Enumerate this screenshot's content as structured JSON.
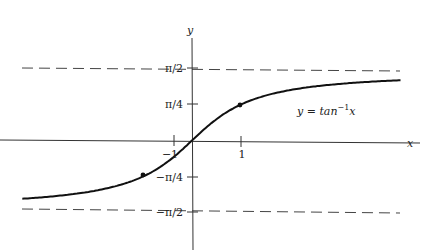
{
  "chart_data": {
    "type": "line",
    "title": "",
    "xlabel": "x",
    "ylabel": "y",
    "function_label": "y = tan⁻¹x",
    "function_label_parts": {
      "prefix": "y = tan",
      "sup": "−1",
      "var": "x"
    },
    "x_ticks": [
      {
        "value": -1,
        "label": "−1"
      },
      {
        "value": 1,
        "label": "1"
      }
    ],
    "y_ticks": [
      {
        "value": 1.5708,
        "label": "π/2"
      },
      {
        "value": 0.7854,
        "label": "π/4"
      },
      {
        "value": -0.7854,
        "label": "−π/4"
      },
      {
        "value": -1.5708,
        "label": "−π/2"
      }
    ],
    "asymptotes": [
      {
        "y": 1.5708,
        "style": "dashed",
        "label": "π/2"
      },
      {
        "y": -1.5708,
        "style": "dashed",
        "label": "−π/2"
      }
    ],
    "marked_points": [
      {
        "x": 1,
        "y": 0.7854
      },
      {
        "x": -1,
        "y": -0.7854
      }
    ],
    "xlim": [
      -3.5,
      4.3
    ],
    "ylim": [
      -2.2,
      2.5
    ],
    "grid": false,
    "series": [
      {
        "name": "arctan",
        "function": "atan(x)",
        "x_range": [
          -3.5,
          4.3
        ]
      }
    ]
  }
}
